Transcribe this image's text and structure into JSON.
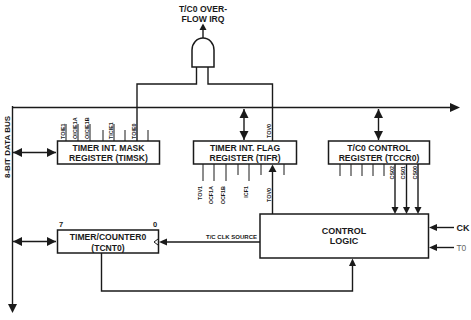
{
  "diagram": {
    "type": "block-diagram",
    "bus": {
      "label": "8-BIT DATA BUS"
    },
    "irq": {
      "label_line1": "T/C0 OVER-",
      "label_line2": "FLOW IRQ",
      "gate": "AND"
    },
    "timsk": {
      "title_line1": "TIMER INT. MASK",
      "title_line2": "REGISTER (TIMSK)",
      "bits": [
        "TOIE1",
        "OICIE1A",
        "OICIE1B",
        "",
        "TICIE1",
        "",
        "TOIE0",
        ""
      ]
    },
    "tifr": {
      "title_line1": "TIMER INT. FLAG",
      "title_line2": "REGISTER (TIFR)",
      "top_bit": "TOV0",
      "bits": [
        "TOV1",
        "OCF1A",
        "OCF1B",
        "",
        "ICF1",
        "",
        "TOV0",
        ""
      ]
    },
    "tccr0": {
      "title_line1": "T/C0 CONTROL",
      "title_line2": "REGISTER (TCCR0)",
      "bits": [
        "",
        "",
        "",
        "",
        "",
        "CS02",
        "CS01",
        "CS00"
      ]
    },
    "tcnt0": {
      "title_line1": "TIMER/COUNTER0",
      "title_line2": "(TCNT0)",
      "msb": "7",
      "lsb": "0"
    },
    "control_logic": {
      "title_line1": "CONTROL",
      "title_line2": "LOGIC",
      "inputs": {
        "ck": "CK",
        "t0": "T0"
      },
      "clk_source_label": "T/C CLK SOURCE"
    }
  }
}
